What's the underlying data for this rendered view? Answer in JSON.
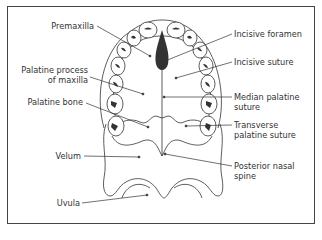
{
  "diagram": {
    "labels_left": [
      {
        "id": "premaxilla",
        "lines": [
          "Premaxilla"
        ]
      },
      {
        "id": "palatine-process",
        "lines": [
          "Palatine process",
          "of maxilla"
        ]
      },
      {
        "id": "palatine-bone",
        "lines": [
          "Palatine bone"
        ]
      },
      {
        "id": "velum",
        "lines": [
          "Velum"
        ]
      },
      {
        "id": "uvula",
        "lines": [
          "Uvula"
        ]
      }
    ],
    "labels_right": [
      {
        "id": "incisive-foramen",
        "lines": [
          "Incisive foramen"
        ]
      },
      {
        "id": "incisive-suture",
        "lines": [
          "Incisive suture"
        ]
      },
      {
        "id": "median-palatine-suture",
        "lines": [
          "Median palatine",
          "suture"
        ]
      },
      {
        "id": "transverse-palatine-suture",
        "lines": [
          "Transverse",
          "palatine suture"
        ]
      },
      {
        "id": "posterior-nasal-spine",
        "lines": [
          "Posterior nasal",
          "spine"
        ]
      }
    ],
    "colors": {
      "line": "#333333",
      "text": "#333333",
      "frame": "#444444",
      "fill": "#222222"
    }
  }
}
